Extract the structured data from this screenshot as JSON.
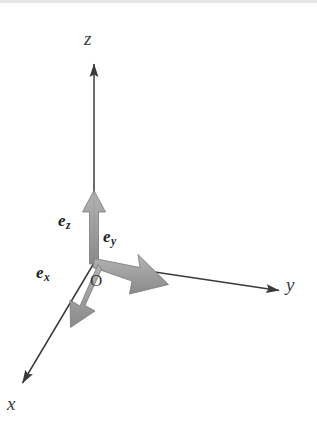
{
  "figure": {
    "kind": "3d-cartesian-coordinate-system",
    "background_color": "#ffffff",
    "axis_color": "#3a3a3a",
    "basis_vector_color": "#9a9a9a",
    "basis_vector_edge_color": "#6f6f6f",
    "text_color": "#2b2b2b",
    "width": 317,
    "height": 431
  },
  "origin": {
    "label": "O",
    "x": 94,
    "y": 263
  },
  "axes": [
    {
      "name": "x",
      "label": "x",
      "label_x": 8,
      "label_y": 399,
      "from": [
        94,
        263
      ],
      "to": [
        19,
        389
      ]
    },
    {
      "name": "y",
      "label": "y",
      "label_x": 288,
      "label_y": 281,
      "from": [
        94,
        263
      ],
      "to": [
        283,
        291
      ]
    },
    {
      "name": "z",
      "label": "z",
      "label_x": 84,
      "label_y": 36,
      "from": [
        94,
        263
      ],
      "to": [
        94,
        60
      ]
    }
  ],
  "basis_vectors": [
    {
      "name": "e_x",
      "label": "e",
      "subscript": "x",
      "label_x": 36,
      "label_y": 265,
      "from": [
        94,
        263
      ],
      "to": [
        72,
        320
      ]
    },
    {
      "name": "e_y",
      "label": "e",
      "subscript": "y",
      "label_x": 103,
      "label_y": 229,
      "from": [
        94,
        263
      ],
      "to": [
        167,
        284
      ]
    },
    {
      "name": "e_z",
      "label": "e",
      "subscript": "z",
      "label_x": 58,
      "label_y": 213,
      "from": [
        94,
        263
      ],
      "to": [
        94,
        191
      ]
    }
  ]
}
